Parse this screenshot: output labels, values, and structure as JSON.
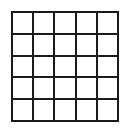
{
  "canvas": {
    "width": 129,
    "height": 128,
    "background_color": "#ffffff"
  },
  "grid": {
    "name": "empty-grid",
    "columns": 5,
    "rows": 5,
    "cells_total": 25,
    "cell_contents": [
      [
        "",
        "",
        "",
        "",
        ""
      ],
      [
        "",
        "",
        "",
        "",
        ""
      ],
      [
        "",
        "",
        "",
        "",
        ""
      ],
      [
        "",
        "",
        "",
        "",
        ""
      ],
      [
        "",
        "",
        "",
        "",
        ""
      ]
    ],
    "line_color": "#1a1a1a",
    "cell_fill_color": "#ffffff",
    "line_thickness_px": 2,
    "left_px": 11,
    "top_px": 11,
    "width_px": 108,
    "height_px": 111
  }
}
